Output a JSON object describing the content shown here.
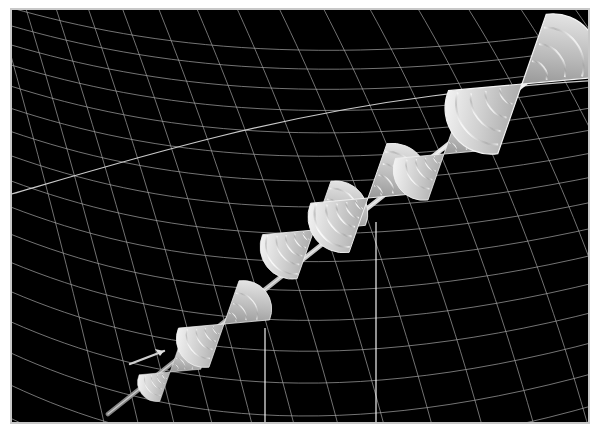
{
  "figure": {
    "title": "",
    "background_color": "#000000",
    "page_color": "#ffffff",
    "frame_color": "#c8c8c8",
    "grid_color": "#a8a8a8",
    "glyph_color": "#e8e8e8",
    "axis_line_color": "#ffffff",
    "width": 600,
    "height": 432
  },
  "chart_data": {
    "type": "scatter",
    "title": "",
    "subtitle": "",
    "xlabel": "",
    "ylabel": "",
    "zlabel": "",
    "legend": [],
    "annotations": [],
    "grid": true,
    "legend_position": "none",
    "projection": "3d",
    "view": {
      "azimuth": -55,
      "elevation": 24
    },
    "surface": {
      "name": "saddle-mesh",
      "description": "curved wireframe mesh surface",
      "u_lines": 26,
      "v_lines": 22,
      "line_color": "#a8a8a8",
      "line_width": 0.7,
      "facecolor": "none"
    },
    "series": [
      {
        "name": "double-cone-glyphs",
        "glyph": "double-cone",
        "count": 6,
        "points": [
          {
            "id": 1,
            "x": 0.08,
            "y": 0.86,
            "size": 0.34,
            "px": 168,
            "py": 370,
            "scale": 0.42,
            "droplines": false
          },
          {
            "id": 2,
            "x": 0.24,
            "y": 0.72,
            "size": 0.52,
            "px": 222,
            "py": 322,
            "scale": 0.62,
            "droplines": true
          },
          {
            "id": 3,
            "x": 0.41,
            "y": 0.56,
            "size": 0.62,
            "px": 312,
            "py": 228,
            "scale": 0.7,
            "droplines": true
          },
          {
            "id": 4,
            "x": 0.57,
            "y": 0.43,
            "size": 0.7,
            "px": 366,
            "py": 196,
            "scale": 0.78,
            "droplines": true
          },
          {
            "id": 5,
            "x": 0.73,
            "y": 0.31,
            "size": 0.62,
            "px": 442,
            "py": 152,
            "scale": 0.66,
            "droplines": false
          },
          {
            "id": 6,
            "x": 0.9,
            "y": 0.14,
            "size": 0.92,
            "px": 520,
            "py": 82,
            "scale": 1.0,
            "droplines": false
          }
        ],
        "path": {
          "visible": true,
          "color": "#d8d8d8",
          "width": 3.0
        }
      }
    ],
    "droplines": {
      "visible": true,
      "color": "#ffffff",
      "width": 1.2,
      "x_positions": [
        263,
        374
      ]
    }
  }
}
